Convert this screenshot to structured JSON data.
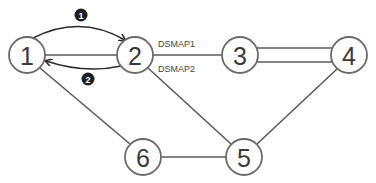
{
  "diagram": {
    "nodes": [
      {
        "id": "1",
        "label": "1"
      },
      {
        "id": "2",
        "label": "2"
      },
      {
        "id": "3",
        "label": "3"
      },
      {
        "id": "4",
        "label": "4"
      },
      {
        "id": "5",
        "label": "5"
      },
      {
        "id": "6",
        "label": "6"
      }
    ],
    "edges": [
      {
        "from": "1",
        "to": "2"
      },
      {
        "from": "2",
        "to": "3",
        "labels": [
          "DSMAP1",
          "DSMAP2"
        ]
      },
      {
        "from": "3",
        "to": "4",
        "style": "double"
      },
      {
        "from": "1",
        "to": "6"
      },
      {
        "from": "2",
        "to": "5"
      },
      {
        "from": "4",
        "to": "5"
      },
      {
        "from": "6",
        "to": "5"
      }
    ],
    "edge_labels": {
      "dsmap1": "DSMAP1",
      "dsmap2": "DSMAP2"
    },
    "arrows": [
      {
        "from": "1",
        "to": "2",
        "step": "1"
      },
      {
        "from": "2",
        "to": "1",
        "step": "2"
      }
    ],
    "step_badges": {
      "step1": "1",
      "step2": "2"
    }
  }
}
